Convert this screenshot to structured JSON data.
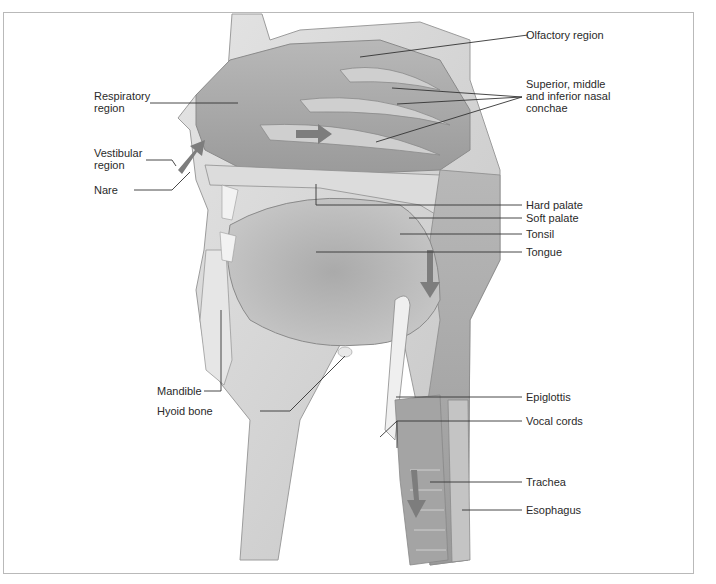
{
  "figure": {
    "colors": {
      "tissue_light": "#d9d9d9",
      "tissue_mid": "#bdbdbd",
      "tissue_dark": "#8f8f8f",
      "airway": "#a8a8a8",
      "arrow": "#7a7a7a",
      "leader_line": "#333333",
      "frame_border": "#b9b9b9"
    }
  },
  "labels_left": {
    "respiratory_region": "Respiratory region",
    "vestibular_region": "Vestibular region",
    "nare": "Nare",
    "mandible": "Mandible",
    "hyoid_bone": "Hyoid bone"
  },
  "labels_right": {
    "olfactory_region": "Olfactory region",
    "nasal_conchae": "Superior, middle and inferior nasal conchae",
    "hard_palate": "Hard palate",
    "soft_palate": "Soft palate",
    "tonsil": "Tonsil",
    "tongue": "Tongue",
    "epiglottis": "Epiglottis",
    "vocal_cords": "Vocal cords",
    "trachea": "Trachea",
    "esophagus": "Esophagus"
  }
}
